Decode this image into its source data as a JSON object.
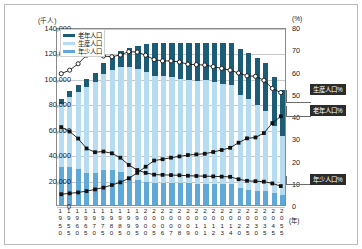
{
  "chart_data": {
    "type": "bar",
    "title": "",
    "subtitle": "",
    "left_axis_caption": "(千人)",
    "right_axis_caption": "(%)",
    "xlabel": "(年)",
    "ylabel": "",
    "grid": true,
    "legend_position": "top-left",
    "ylim": [
      0,
      140000
    ],
    "y2lim": [
      0,
      80
    ],
    "yticks": [
      "0",
      "20,000",
      "40,000",
      "60,000",
      "80,000",
      "100,000",
      "120,000",
      "140,000"
    ],
    "ytick_values": [
      0,
      20000,
      40000,
      60000,
      80000,
      100000,
      120000,
      140000
    ],
    "y2ticks": [
      "0",
      "10",
      "20",
      "30",
      "40",
      "50",
      "60",
      "70",
      "80"
    ],
    "y2tick_values": [
      0,
      10,
      20,
      30,
      40,
      50,
      60,
      70,
      80
    ],
    "categories": [
      "1950",
      "1955",
      "1960",
      "1965",
      "1970",
      "1975",
      "1980",
      "1985",
      "1990",
      "1995",
      "2000",
      "2005",
      "2006",
      "2007",
      "2008",
      "2009",
      "2010",
      "2011",
      "2012",
      "2013",
      "2014",
      "2020",
      "2025",
      "2030",
      "2035",
      "2045",
      "2055"
    ],
    "series": [
      {
        "name": "年少人口",
        "axis": "left",
        "kind": "bar-segment",
        "color": "#5fa8d8",
        "values": [
          29786,
          30123,
          28434,
          25529,
          25153,
          27221,
          27507,
          26033,
          22486,
          20014,
          18472,
          17521,
          17435,
          17293,
          17176,
          17011,
          16803,
          16705,
          16547,
          16390,
          16233,
          13240,
          12039,
          11287,
          10715,
          9387,
          8214
        ]
      },
      {
        "name": "生産人口",
        "axis": "left",
        "kind": "bar-segment",
        "color": "#b6dcf2",
        "values": [
          49658,
          54729,
          60469,
          67444,
          71566,
          75807,
          78835,
          82506,
          85904,
          87165,
          86220,
          84092,
          83731,
          83015,
          82300,
          81493,
          81032,
          81342,
          80175,
          79010,
          77850,
          73408,
          70960,
          67404,
          63430,
          53000,
          45951
        ]
      },
      {
        "name": "老年人口",
        "axis": "left",
        "kind": "bar-segment",
        "color": "#1c5c77",
        "values": [
          4109,
          4747,
          5398,
          6236,
          7393,
          8865,
          10647,
          12468,
          14895,
          18261,
          22005,
          25672,
          26604,
          27464,
          28216,
          29005,
          29484,
          29752,
          30793,
          31898,
          33000,
          36124,
          36573,
          36670,
          37249,
          38564,
          36463
        ]
      },
      {
        "name": "年少人口%",
        "axis": "right",
        "kind": "line",
        "marker": "filled-square",
        "color": "#111111",
        "values": [
          35.4,
          33.4,
          30.2,
          25.7,
          24.0,
          24.3,
          23.5,
          21.5,
          18.2,
          15.9,
          14.6,
          13.8,
          13.7,
          13.6,
          13.5,
          13.3,
          13.2,
          13.1,
          13.0,
          12.9,
          12.8,
          11.7,
          11.0,
          10.8,
          10.6,
          9.8,
          8.6
        ]
      },
      {
        "name": "生産人口%",
        "axis": "right",
        "kind": "line",
        "marker": "open-circle",
        "color": "#111111",
        "values": [
          59.7,
          61.3,
          64.2,
          68.1,
          68.9,
          67.7,
          67.4,
          68.2,
          69.7,
          69.5,
          68.1,
          66.1,
          65.5,
          65.5,
          65.0,
          64.0,
          63.8,
          63.6,
          62.9,
          62.1,
          61.3,
          60.0,
          58.7,
          58.5,
          56.7,
          53.0,
          51.1
        ]
      },
      {
        "name": "老年人口%",
        "axis": "right",
        "kind": "line",
        "marker": "filled-square",
        "color": "#111111",
        "values": [
          4.9,
          5.3,
          5.7,
          6.3,
          7.1,
          7.9,
          9.1,
          10.3,
          12.1,
          14.6,
          17.4,
          20.2,
          20.8,
          21.5,
          22.1,
          22.7,
          23.0,
          23.3,
          24.1,
          25.0,
          26.0,
          28.3,
          30.3,
          30.7,
          32.7,
          37.2,
          40.3
        ]
      }
    ],
    "legend": [
      {
        "label": "老年人口",
        "color": "#1c5c77"
      },
      {
        "label": "生産人口",
        "color": "#b6dcf2"
      },
      {
        "label": "年少人口",
        "color": "#5fa8d8"
      }
    ],
    "annotations": [
      {
        "label": "生産人口%"
      },
      {
        "label": "老年人口%"
      },
      {
        "label": "年少人口%"
      }
    ]
  }
}
